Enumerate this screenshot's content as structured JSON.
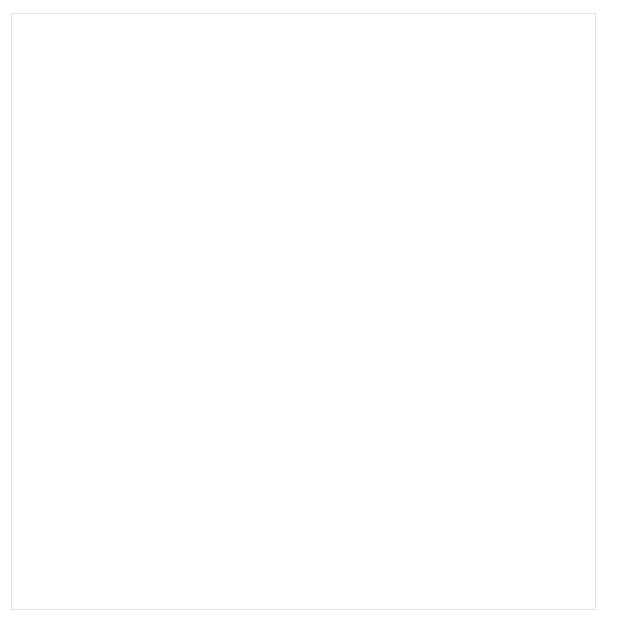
{
  "top_cut_text": "Figure 4. Scatter Plot Matrix of Fisher Iris Data",
  "chart": {
    "marker_color": "#6e6e6e",
    "frame_color": "#bfbfbf",
    "text_color": "#111111"
  },
  "chart_data": {
    "type": "scatter",
    "layout": "2x2 scatter plot matrix",
    "grid": false,
    "legend": "none",
    "units_note": "all measurements in millimeters (cm x 10)",
    "panels": [
      {
        "id": "panel-petal-length-vs-petal-width",
        "position": "top-left",
        "xlabel": "Petal Width",
        "ylabel": "Petal Length",
        "xticks": [
          0,
          5,
          10,
          15,
          20,
          25
        ],
        "yticks": [
          10,
          30,
          50,
          70
        ],
        "xlim": [
          -2,
          27
        ],
        "ylim": [
          6,
          73
        ],
        "x_field": "petal_width",
        "y_field": "petal_length"
      },
      {
        "id": "panel-sepal-length-vs-sepal-width",
        "position": "top-right",
        "xlabel": "Sepal Width",
        "ylabel": "Sepal Length",
        "xticks": [
          20,
          25,
          30,
          35,
          40,
          45
        ],
        "yticks": [
          40,
          50,
          60,
          70,
          80
        ],
        "xlim": [
          18,
          46
        ],
        "ylim": [
          41,
          82
        ],
        "x_field": "sepal_width",
        "y_field": "sepal_length"
      },
      {
        "id": "panel-petal-length-vs-sepal-length",
        "position": "bottom-left",
        "xlabel": "Sepal Length",
        "ylabel": "Petal Length",
        "xticks": [
          40,
          50,
          60,
          70,
          80
        ],
        "yticks": [
          10,
          30,
          50,
          70
        ],
        "xlim": [
          41,
          82
        ],
        "ylim": [
          6,
          73
        ],
        "x_field": "sepal_length",
        "y_field": "petal_length"
      },
      {
        "id": "panel-petal-width-vs-sepal-width",
        "position": "bottom-right",
        "xlabel": "Sepal Width",
        "ylabel": "Petal Width",
        "xticks": [
          20,
          25,
          30,
          35,
          40,
          45
        ],
        "yticks": [
          0,
          5,
          10,
          15,
          20,
          25
        ],
        "xlim": [
          18,
          46
        ],
        "ylim": [
          -2,
          27
        ],
        "x_field": "petal_width",
        "y_field": "sepal_width"
      }
    ],
    "columns": [
      "sepal_length",
      "sepal_width",
      "petal_length",
      "petal_width"
    ],
    "n_points": 150,
    "rows": [
      [
        51,
        35,
        14,
        2
      ],
      [
        49,
        30,
        14,
        2
      ],
      [
        47,
        32,
        13,
        2
      ],
      [
        46,
        31,
        15,
        2
      ],
      [
        50,
        36,
        14,
        2
      ],
      [
        54,
        39,
        17,
        4
      ],
      [
        46,
        34,
        14,
        3
      ],
      [
        50,
        34,
        15,
        2
      ],
      [
        44,
        29,
        14,
        2
      ],
      [
        49,
        31,
        15,
        1
      ],
      [
        54,
        37,
        15,
        2
      ],
      [
        48,
        34,
        16,
        2
      ],
      [
        48,
        30,
        14,
        1
      ],
      [
        43,
        30,
        11,
        1
      ],
      [
        58,
        40,
        12,
        2
      ],
      [
        57,
        44,
        15,
        4
      ],
      [
        54,
        39,
        13,
        4
      ],
      [
        51,
        35,
        14,
        3
      ],
      [
        57,
        38,
        17,
        3
      ],
      [
        51,
        38,
        15,
        3
      ],
      [
        54,
        34,
        17,
        2
      ],
      [
        51,
        37,
        15,
        4
      ],
      [
        46,
        36,
        10,
        2
      ],
      [
        51,
        33,
        17,
        5
      ],
      [
        48,
        34,
        19,
        2
      ],
      [
        50,
        30,
        16,
        2
      ],
      [
        50,
        34,
        16,
        4
      ],
      [
        52,
        35,
        15,
        2
      ],
      [
        52,
        34,
        14,
        2
      ],
      [
        47,
        32,
        16,
        2
      ],
      [
        48,
        31,
        16,
        2
      ],
      [
        54,
        34,
        15,
        4
      ],
      [
        52,
        41,
        15,
        1
      ],
      [
        55,
        42,
        14,
        2
      ],
      [
        49,
        31,
        15,
        2
      ],
      [
        50,
        32,
        12,
        2
      ],
      [
        55,
        35,
        13,
        2
      ],
      [
        49,
        36,
        14,
        1
      ],
      [
        44,
        30,
        13,
        2
      ],
      [
        51,
        34,
        15,
        2
      ],
      [
        50,
        35,
        13,
        3
      ],
      [
        45,
        23,
        13,
        3
      ],
      [
        44,
        32,
        13,
        2
      ],
      [
        50,
        35,
        16,
        6
      ],
      [
        51,
        38,
        19,
        4
      ],
      [
        48,
        30,
        14,
        3
      ],
      [
        51,
        38,
        16,
        2
      ],
      [
        46,
        32,
        14,
        2
      ],
      [
        53,
        37,
        15,
        2
      ],
      [
        50,
        33,
        14,
        2
      ],
      [
        70,
        32,
        47,
        14
      ],
      [
        64,
        32,
        45,
        15
      ],
      [
        69,
        31,
        49,
        15
      ],
      [
        55,
        23,
        40,
        13
      ],
      [
        65,
        28,
        46,
        15
      ],
      [
        57,
        28,
        45,
        13
      ],
      [
        63,
        33,
        47,
        16
      ],
      [
        49,
        24,
        33,
        10
      ],
      [
        66,
        29,
        46,
        13
      ],
      [
        52,
        27,
        39,
        14
      ],
      [
        50,
        20,
        35,
        10
      ],
      [
        59,
        30,
        42,
        15
      ],
      [
        60,
        22,
        40,
        10
      ],
      [
        61,
        29,
        47,
        14
      ],
      [
        56,
        29,
        36,
        13
      ],
      [
        67,
        31,
        44,
        14
      ],
      [
        56,
        30,
        45,
        15
      ],
      [
        58,
        27,
        41,
        10
      ],
      [
        62,
        22,
        45,
        15
      ],
      [
        56,
        25,
        39,
        11
      ],
      [
        59,
        32,
        48,
        18
      ],
      [
        61,
        28,
        40,
        13
      ],
      [
        63,
        25,
        49,
        15
      ],
      [
        61,
        28,
        47,
        12
      ],
      [
        64,
        29,
        43,
        13
      ],
      [
        66,
        30,
        44,
        14
      ],
      [
        68,
        28,
        48,
        14
      ],
      [
        67,
        30,
        50,
        17
      ],
      [
        60,
        29,
        45,
        15
      ],
      [
        57,
        26,
        35,
        10
      ],
      [
        55,
        24,
        38,
        11
      ],
      [
        55,
        24,
        37,
        10
      ],
      [
        58,
        27,
        39,
        12
      ],
      [
        60,
        27,
        51,
        16
      ],
      [
        54,
        30,
        45,
        15
      ],
      [
        60,
        34,
        45,
        16
      ],
      [
        67,
        31,
        47,
        15
      ],
      [
        63,
        23,
        44,
        13
      ],
      [
        56,
        30,
        41,
        13
      ],
      [
        55,
        25,
        40,
        13
      ],
      [
        55,
        26,
        44,
        12
      ],
      [
        61,
        30,
        46,
        14
      ],
      [
        58,
        26,
        40,
        12
      ],
      [
        50,
        23,
        33,
        10
      ],
      [
        56,
        27,
        42,
        13
      ],
      [
        57,
        30,
        42,
        12
      ],
      [
        57,
        29,
        42,
        13
      ],
      [
        62,
        29,
        43,
        13
      ],
      [
        51,
        25,
        30,
        11
      ],
      [
        57,
        28,
        41,
        13
      ],
      [
        63,
        33,
        60,
        25
      ],
      [
        58,
        27,
        51,
        19
      ],
      [
        71,
        30,
        59,
        21
      ],
      [
        63,
        29,
        56,
        18
      ],
      [
        65,
        30,
        58,
        22
      ],
      [
        76,
        30,
        66,
        21
      ],
      [
        49,
        25,
        45,
        17
      ],
      [
        73,
        29,
        63,
        18
      ],
      [
        67,
        25,
        58,
        18
      ],
      [
        72,
        36,
        61,
        25
      ],
      [
        65,
        32,
        51,
        20
      ],
      [
        64,
        27,
        53,
        19
      ],
      [
        68,
        30,
        55,
        21
      ],
      [
        57,
        25,
        50,
        20
      ],
      [
        58,
        28,
        51,
        24
      ],
      [
        64,
        32,
        53,
        23
      ],
      [
        65,
        30,
        55,
        18
      ],
      [
        77,
        38,
        67,
        22
      ],
      [
        77,
        26,
        69,
        23
      ],
      [
        60,
        22,
        50,
        15
      ],
      [
        69,
        32,
        57,
        23
      ],
      [
        56,
        28,
        49,
        20
      ],
      [
        77,
        28,
        67,
        20
      ],
      [
        63,
        27,
        49,
        18
      ],
      [
        67,
        33,
        57,
        21
      ],
      [
        72,
        32,
        60,
        18
      ],
      [
        62,
        28,
        48,
        18
      ],
      [
        61,
        30,
        49,
        18
      ],
      [
        64,
        28,
        56,
        21
      ],
      [
        72,
        30,
        58,
        16
      ],
      [
        74,
        28,
        61,
        19
      ],
      [
        79,
        38,
        64,
        20
      ],
      [
        64,
        28,
        56,
        22
      ],
      [
        63,
        28,
        51,
        15
      ],
      [
        61,
        26,
        56,
        14
      ],
      [
        77,
        30,
        61,
        23
      ],
      [
        63,
        34,
        56,
        24
      ],
      [
        64,
        31,
        55,
        18
      ],
      [
        60,
        30,
        48,
        18
      ],
      [
        69,
        31,
        54,
        21
      ],
      [
        67,
        31,
        56,
        24
      ],
      [
        69,
        31,
        51,
        23
      ],
      [
        58,
        27,
        51,
        19
      ],
      [
        68,
        32,
        59,
        23
      ],
      [
        67,
        33,
        57,
        25
      ],
      [
        67,
        30,
        52,
        23
      ],
      [
        63,
        25,
        50,
        19
      ],
      [
        65,
        30,
        52,
        20
      ],
      [
        62,
        34,
        54,
        23
      ],
      [
        59,
        30,
        51,
        18
      ]
    ]
  }
}
